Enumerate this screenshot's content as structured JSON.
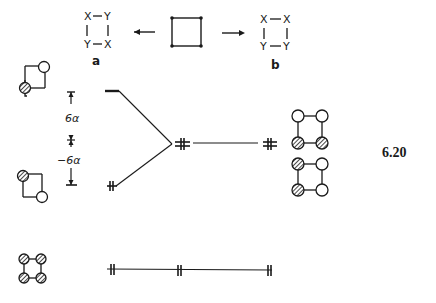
{
  "top": {
    "left_square": {
      "corners": [
        "X",
        "Y",
        "Y",
        "X"
      ],
      "label": "a"
    },
    "right_square": {
      "corners": [
        "X",
        "X",
        "Y",
        "Y"
      ],
      "label": "b"
    }
  },
  "energy": {
    "upper_gap_label": "6α",
    "lower_gap_label": "−6α"
  },
  "figure_number": "6.20",
  "colors": {
    "ink": "#1a1a1a",
    "paper": "#ffffff"
  }
}
